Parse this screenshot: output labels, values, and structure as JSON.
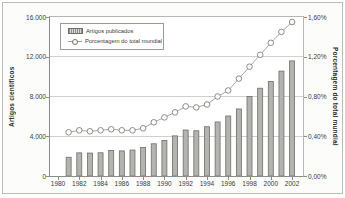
{
  "figure": {
    "background": "#fcfcfa",
    "border_color": "#bdbdb8"
  },
  "chart_data": {
    "type": "bar",
    "subtype": "bar-line combo, dual axis",
    "categories": [
      1981,
      1982,
      1983,
      1984,
      1985,
      1986,
      1987,
      1988,
      1989,
      1990,
      1991,
      1992,
      1993,
      1994,
      1995,
      1996,
      1997,
      1998,
      1999,
      2000,
      2001,
      2002
    ],
    "series": [
      {
        "name": "Artigos publicados",
        "type": "bar",
        "axis": "left",
        "values": [
          1887,
          2329,
          2306,
          2339,
          2568,
          2525,
          2610,
          2866,
          3242,
          3564,
          4038,
          4627,
          4553,
          4958,
          5440,
          6038,
          6747,
          8003,
          8833,
          9511,
          10555,
          11581
        ]
      },
      {
        "name": "Porcentagem do total mundial",
        "type": "line",
        "axis": "right",
        "values": [
          0.44,
          0.46,
          0.45,
          0.46,
          0.47,
          0.46,
          0.46,
          0.48,
          0.54,
          0.59,
          0.64,
          0.7,
          0.69,
          0.72,
          0.8,
          0.86,
          0.98,
          1.1,
          1.22,
          1.34,
          1.45,
          1.55
        ]
      }
    ],
    "left_axis": {
      "title": "Artigos científicos",
      "min": 0,
      "max": 16000,
      "ticks": [
        {
          "value": 16000,
          "label": "16.000"
        },
        {
          "value": 12000,
          "label": "12.000"
        },
        {
          "value": 8000,
          "label": "8.000"
        },
        {
          "value": 4000,
          "label": "4.000"
        },
        {
          "value": 0,
          "label": "0"
        }
      ]
    },
    "right_axis": {
      "title": "Porcentagem do total mundial",
      "min": 0,
      "max": 1.6,
      "ticks": [
        {
          "value": 1.6,
          "label": "1,60%"
        },
        {
          "value": 1.2,
          "label": "1,20%"
        },
        {
          "value": 0.8,
          "label": "0,80%"
        },
        {
          "value": 0.4,
          "label": "0,40%"
        },
        {
          "value": 0.0,
          "label": "0,00%"
        }
      ]
    },
    "x_axis": {
      "ticks": [
        {
          "value": 1980,
          "label": "1980"
        },
        {
          "value": 1982,
          "label": "1982"
        },
        {
          "value": 1984,
          "label": "1984"
        },
        {
          "value": 1986,
          "label": "1986"
        },
        {
          "value": 1988,
          "label": "1988"
        },
        {
          "value": 1990,
          "label": "1990"
        },
        {
          "value": 1992,
          "label": "1992"
        },
        {
          "value": 1994,
          "label": "1994"
        },
        {
          "value": 1996,
          "label": "1996"
        },
        {
          "value": 1998,
          "label": "1998"
        },
        {
          "value": 2000,
          "label": "2000"
        },
        {
          "value": 2002,
          "label": "2002"
        }
      ]
    },
    "legend": [
      "Artigos publicados",
      "Porcentagem do total mundial"
    ],
    "legend_position": "top-left inside plot",
    "grid": "horizontal gridlines on",
    "colors": {
      "bar_fill": "#b3b3b0",
      "bar_stroke": "#6e6e6a",
      "line": "#9a9a96",
      "marker_fill": "#ffffff",
      "marker_stroke": "#6e6e6a",
      "gridline": "#cfcfcb",
      "text": "#3a3a38"
    }
  }
}
